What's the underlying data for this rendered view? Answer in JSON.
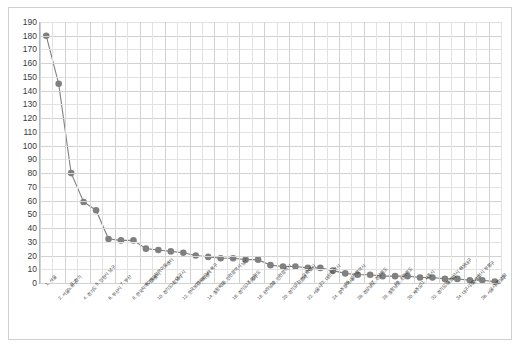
{
  "chart_data": {
    "type": "line",
    "title": "",
    "subtitle": "",
    "xlabel": "",
    "ylabel": "",
    "ylim": [
      0,
      190
    ],
    "ytick_step": 10,
    "grid": true,
    "legend": false,
    "legend_position": "none",
    "marker": "circle",
    "marker_color": "#808080",
    "line_color": "#808080",
    "yticks": [
      190,
      180,
      170,
      160,
      150,
      140,
      130,
      120,
      110,
      100,
      90,
      80,
      70,
      60,
      50,
      40,
      30,
      20,
      10,
      0
    ],
    "categories": [
      "1. 서울",
      "2. 서울노원구",
      "3. 경기",
      "4. 경기도",
      "5. 인천시 남구",
      "6. 부산시",
      "7. 부산",
      "8. 한국지역아동센터",
      "9. 한국지역아동센터",
      "10. 경기도 성남시",
      "11. 대구시",
      "12. 한국보건복지센터",
      "13. 부산시 북구",
      "14. 충청북도",
      "15. 인천광역시 남구",
      "16. 경기도 수원시",
      "17. 강원도",
      "18. 전라남도",
      "19. 인천광역시",
      "20. 경기도 고양시",
      "21. 서울특별시",
      "22. 서울시",
      "23. 대전광역시",
      "24. 광주광역시",
      "25. 울산광역시",
      "26. 경상남도",
      "27. 경상북도",
      "28. 충청남도",
      "29. 전라북도",
      "30. 제주도",
      "31. 세종시",
      "32. 경기도 용인시",
      "33. 부산시 해운대구",
      "34. 대구시 달서구",
      "35. 인천시 부평구",
      "36. 서울시 강남구",
      "37. 기타"
    ],
    "values": [
      180,
      145,
      80,
      59,
      53,
      32,
      31,
      31,
      25,
      24,
      23,
      22,
      20,
      19,
      18,
      18,
      17,
      17,
      13,
      12,
      12,
      11,
      11,
      9,
      7,
      6,
      6,
      5,
      5,
      5,
      4,
      4,
      3,
      3,
      2,
      2,
      1
    ]
  }
}
